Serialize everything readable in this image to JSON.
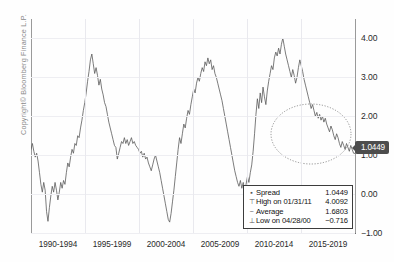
{
  "copyright": "Copyright© Bloomberg Finance L.P.",
  "last_value_badge": "1.0449",
  "legend": {
    "rows": [
      {
        "marker": "▪",
        "label": "Spread",
        "value": "1.0449"
      },
      {
        "marker": "⊤",
        "label": "High on 01/31/11",
        "value": "4.0092"
      },
      {
        "marker": "−",
        "label": "Average",
        "value": "1.6803"
      },
      {
        "marker": "⊥",
        "label": "Low on 04/28/00",
        "value": "−0.716"
      }
    ]
  },
  "colors": {
    "line": "#5a5a5a",
    "axis": "#6e6e6e",
    "grid": "#ebebf0",
    "badge_bg": "#4d4d4d",
    "legend_border": "#3c3c3c",
    "copyright_text": "#8a8a8a"
  },
  "chart_data": {
    "type": "line",
    "title": "",
    "xlabel": "",
    "ylabel": "",
    "grid": true,
    "legend_position": "bottom-right",
    "ylim": [
      -1.0,
      4.5
    ],
    "yticks": [
      "4.00",
      "3.00",
      "2.00",
      "1.00",
      "0.00",
      "-1.00"
    ],
    "ytick_values": [
      4.0,
      3.0,
      2.0,
      1.0,
      0.0,
      -1.0
    ],
    "xticks": [
      "1990-1994",
      "1995-1999",
      "2000-2004",
      "2005-2009",
      "2010-2014",
      "2015-2019"
    ],
    "annotations": [
      {
        "type": "ellipse",
        "label": "highlight-ellipse",
        "x_range": [
          "2015",
          "2019"
        ],
        "y_range": [
          1.2,
          2.3
        ]
      },
      {
        "type": "value-callout",
        "label": "1.0449",
        "axis": "right"
      }
    ],
    "series": [
      {
        "name": "Spread",
        "last": 1.0449,
        "high": 4.0092,
        "high_date": "01/31/11",
        "average": 1.6803,
        "low": -0.716,
        "low_date": "04/28/00",
        "values": [
          1.15,
          1.3,
          1.1,
          0.95,
          1.05,
          0.85,
          0.55,
          0.25,
          0.05,
          0.3,
          0.1,
          -0.45,
          -0.7,
          -0.35,
          -0.05,
          0.2,
          0.05,
          0.3,
          0.1,
          -0.15,
          0.05,
          0.3,
          0.15,
          0.35,
          0.25,
          0.55,
          0.8,
          0.7,
          0.95,
          1.15,
          1.05,
          1.3,
          1.25,
          1.5,
          1.45,
          1.7,
          1.9,
          2.15,
          2.35,
          2.6,
          2.9,
          3.15,
          3.45,
          3.6,
          3.35,
          3.1,
          3.25,
          3.05,
          2.8,
          2.95,
          2.7,
          2.55,
          2.35,
          2.25,
          2.05,
          1.85,
          1.7,
          1.55,
          1.4,
          1.25,
          1.2,
          0.9,
          1.05,
          1.2,
          1.35,
          1.3,
          1.45,
          1.3,
          1.4,
          1.25,
          1.35,
          1.45,
          1.3,
          1.35,
          1.25,
          1.2,
          1.15,
          1.05,
          1.1,
          0.95,
          1.05,
          0.9,
          0.95,
          0.8,
          0.7,
          0.6,
          0.75,
          0.9,
          1.0,
          0.85,
          0.7,
          0.55,
          0.35,
          0.15,
          -0.05,
          -0.25,
          -0.45,
          -0.65,
          -0.72,
          -0.5,
          -0.2,
          0.1,
          0.45,
          0.8,
          1.15,
          1.45,
          1.3,
          1.55,
          1.8,
          1.7,
          1.95,
          2.15,
          2.05,
          2.3,
          2.5,
          2.7,
          2.6,
          2.85,
          3.0,
          2.9,
          3.1,
          3.25,
          3.15,
          3.4,
          3.3,
          3.5,
          3.35,
          3.45,
          3.2,
          3.3,
          3.1,
          3.0,
          2.85,
          2.7,
          2.55,
          2.4,
          2.2,
          2.0,
          1.8,
          1.6,
          1.4,
          1.2,
          1.0,
          0.8,
          0.6,
          0.45,
          0.3,
          0.2,
          0.35,
          0.15,
          0.3,
          0.1,
          0.25,
          0.45,
          0.3,
          0.55,
          0.75,
          1.1,
          1.55,
          2.05,
          2.45,
          2.2,
          2.6,
          2.35,
          2.75,
          2.5,
          2.3,
          2.65,
          2.9,
          3.1,
          3.3,
          3.2,
          3.5,
          3.65,
          3.55,
          3.75,
          3.6,
          3.85,
          4.01,
          3.8,
          3.6,
          3.45,
          3.3,
          3.15,
          3.0,
          3.2,
          3.05,
          2.85,
          3.0,
          3.25,
          3.45,
          3.3,
          3.15,
          2.95,
          2.8,
          2.65,
          2.5,
          2.35,
          2.2,
          2.3,
          2.15,
          2.0,
          2.1,
          1.95,
          2.05,
          1.9,
          2.0,
          1.85,
          1.95,
          1.8,
          1.7,
          1.6,
          1.75,
          1.65,
          1.5,
          1.4,
          1.55,
          1.45,
          1.3,
          1.2,
          1.35,
          1.25,
          1.15,
          1.3,
          1.2,
          1.1,
          1.25,
          1.15,
          1.05,
          1.0449
        ]
      }
    ]
  }
}
